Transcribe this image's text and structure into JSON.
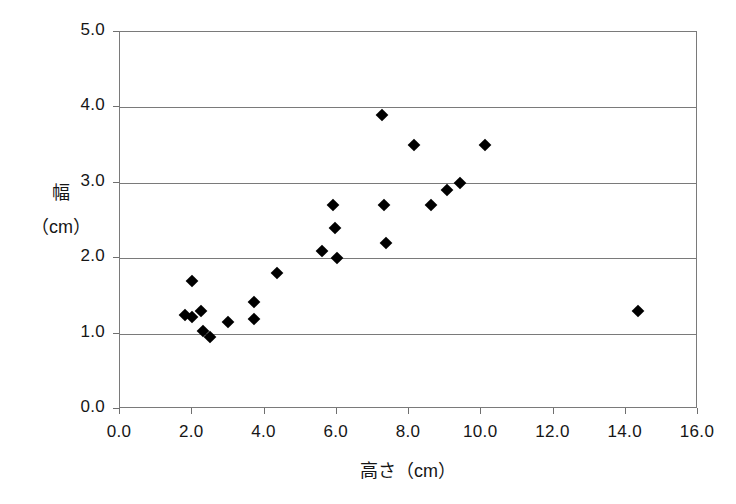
{
  "chart_data": {
    "type": "scatter",
    "title": "",
    "xlabel": "高さ（cm）",
    "ylabel_line1": "幅",
    "ylabel_line2": "（cm）",
    "xlim": [
      0.0,
      16.0
    ],
    "ylim": [
      0.0,
      5.0
    ],
    "xticks": [
      "0.0",
      "2.0",
      "4.0",
      "6.0",
      "8.0",
      "10.0",
      "12.0",
      "14.0",
      "16.0"
    ],
    "xtick_values": [
      0.0,
      2.0,
      4.0,
      6.0,
      8.0,
      10.0,
      12.0,
      14.0,
      16.0
    ],
    "yticks": [
      "0.0",
      "1.0",
      "2.0",
      "3.0",
      "4.0",
      "5.0"
    ],
    "ytick_values": [
      0.0,
      1.0,
      2.0,
      3.0,
      4.0,
      5.0
    ],
    "grid": "horizontal",
    "gridlines_y": [
      1.0,
      2.0,
      3.0,
      4.0
    ],
    "legend": "none",
    "marker": "diamond",
    "marker_color": "#000000",
    "frame_color": "#7a7a7a",
    "series": [
      {
        "name": "観測値",
        "points": [
          {
            "x": 1.8,
            "y": 1.25
          },
          {
            "x": 2.0,
            "y": 1.7
          },
          {
            "x": 2.0,
            "y": 1.22
          },
          {
            "x": 2.25,
            "y": 1.3
          },
          {
            "x": 2.3,
            "y": 1.03
          },
          {
            "x": 2.5,
            "y": 0.95
          },
          {
            "x": 3.0,
            "y": 1.15
          },
          {
            "x": 3.7,
            "y": 1.42
          },
          {
            "x": 3.7,
            "y": 1.2
          },
          {
            "x": 4.35,
            "y": 1.8
          },
          {
            "x": 5.6,
            "y": 2.1
          },
          {
            "x": 5.9,
            "y": 2.7
          },
          {
            "x": 5.95,
            "y": 2.4
          },
          {
            "x": 6.0,
            "y": 2.0
          },
          {
            "x": 7.25,
            "y": 3.9
          },
          {
            "x": 7.3,
            "y": 2.7
          },
          {
            "x": 7.35,
            "y": 2.2
          },
          {
            "x": 8.15,
            "y": 3.5
          },
          {
            "x": 8.6,
            "y": 2.7
          },
          {
            "x": 9.05,
            "y": 2.9
          },
          {
            "x": 9.4,
            "y": 3.0
          },
          {
            "x": 10.1,
            "y": 3.5
          },
          {
            "x": 14.35,
            "y": 1.3
          }
        ]
      }
    ]
  }
}
